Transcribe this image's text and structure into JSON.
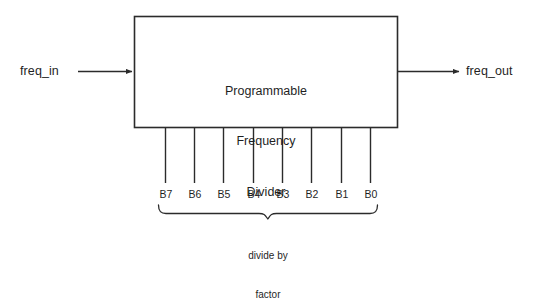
{
  "diagram": {
    "type": "block-diagram",
    "background_color": "#ffffff",
    "line_color": "#2b2b2b",
    "text_color": "#1f1f1f",
    "block": {
      "title_lines": [
        "Programmable",
        "Frequency",
        "Divider"
      ],
      "title_line_1": "Programmable",
      "title_line_2": "Frequency",
      "title_line_3": "Divider",
      "x": 134,
      "y": 16,
      "width": 264,
      "height": 112
    },
    "ports": {
      "input_label": "freq_in",
      "output_label": "freq_out"
    },
    "control_bus": {
      "bit_labels": [
        "B7",
        "B6",
        "B5",
        "B4",
        "B3",
        "B2",
        "B1",
        "B0"
      ],
      "bit_count": 8,
      "caption_line_1": "divide by",
      "caption_line_2": "factor",
      "caption": "divide by factor"
    }
  }
}
